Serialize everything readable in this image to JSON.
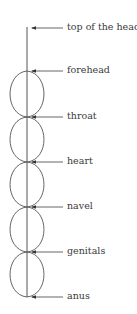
{
  "diagram": {
    "type": "chakra-axis",
    "axis": {
      "x": 27,
      "top": 27,
      "bottom": 297
    },
    "lobe_half_width": 17,
    "stroke_color": "#555555",
    "label_color": "#3a3a3a",
    "top_marker": {
      "label": "top of the head",
      "y": 28
    },
    "nodes": [
      {
        "label": "forehead",
        "y": 71
      },
      {
        "label": "throat",
        "y": 117
      },
      {
        "label": "heart",
        "y": 162
      },
      {
        "label": "navel",
        "y": 207
      },
      {
        "label": "genitals",
        "y": 252
      },
      {
        "label": "anus",
        "y": 297
      }
    ]
  }
}
